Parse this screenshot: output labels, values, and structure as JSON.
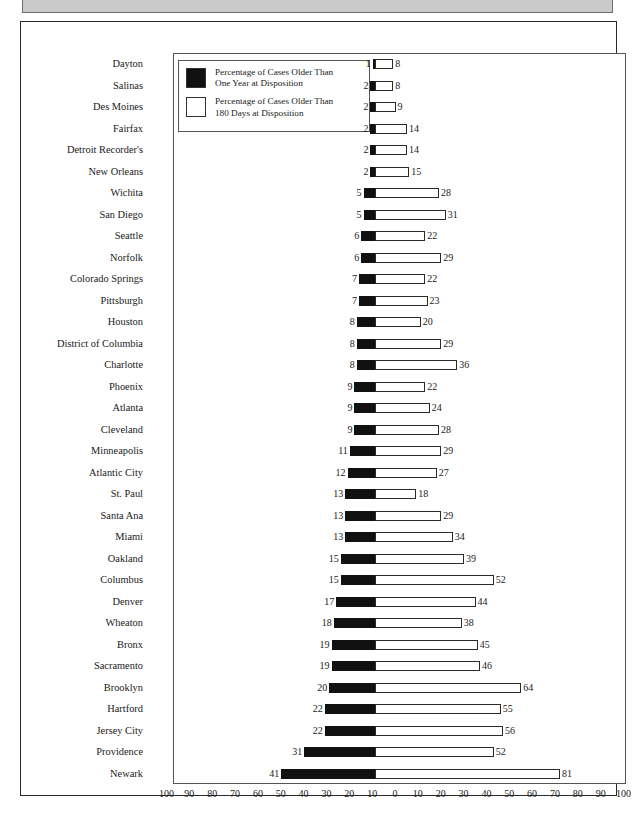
{
  "chart_data": {
    "type": "bar",
    "orientation": "horizontal-diverging",
    "title": "",
    "xlabel": "",
    "ylabel": "",
    "grid": false,
    "legend_position": "top-left-inside",
    "axis": {
      "ticks": [
        100,
        90,
        80,
        70,
        60,
        50,
        40,
        30,
        20,
        10,
        0,
        10,
        20,
        30,
        40,
        50,
        60,
        70,
        80,
        90,
        100
      ],
      "left_range": [
        0,
        100
      ],
      "right_range": [
        0,
        100
      ],
      "center_value": 0
    },
    "legend": [
      {
        "key": "over_one_year",
        "swatch": "black",
        "label": "Percentage of Cases Older Than\nOne Year at Disposition"
      },
      {
        "key": "over_180_days",
        "swatch": "white",
        "label": "Percentage of Cases Older Than\n180 Days at Disposition"
      }
    ],
    "series": [
      {
        "name": "Percentage of Cases Older Than One Year at Disposition",
        "key": "over_one_year",
        "side": "left",
        "swatch": "black"
      },
      {
        "name": "Percentage of Cases Older Than 180 Days at Disposition",
        "key": "over_180_days",
        "side": "right",
        "swatch": "white"
      }
    ],
    "categories": [
      "Dayton",
      "Salinas",
      "Des Moines",
      "Fairfax",
      "Detroit Recorder's",
      "New Orleans",
      "Wichita",
      "San Diego",
      "Seattle",
      "Norfolk",
      "Colorado Springs",
      "Pittsburgh",
      "Houston",
      "District of Columbia",
      "Charlotte",
      "Phoenix",
      "Atlanta",
      "Cleveland",
      "Minneapolis",
      "Atlantic City",
      "St. Paul",
      "Santa Ana",
      "Miami",
      "Oakland",
      "Columbus",
      "Denver",
      "Wheaton",
      "Bronx",
      "Sacramento",
      "Brooklyn",
      "Hartford",
      "Jersey City",
      "Providence",
      "Newark"
    ],
    "rows": [
      {
        "city": "Dayton",
        "over_one_year": 1,
        "over_180_days": 8
      },
      {
        "city": "Salinas",
        "over_one_year": 2,
        "over_180_days": 8
      },
      {
        "city": "Des Moines",
        "over_one_year": 2,
        "over_180_days": 9
      },
      {
        "city": "Fairfax",
        "over_one_year": 2,
        "over_180_days": 14
      },
      {
        "city": "Detroit Recorder's",
        "over_one_year": 2,
        "over_180_days": 14
      },
      {
        "city": "New Orleans",
        "over_one_year": 2,
        "over_180_days": 15
      },
      {
        "city": "Wichita",
        "over_one_year": 5,
        "over_180_days": 28
      },
      {
        "city": "San Diego",
        "over_one_year": 5,
        "over_180_days": 31
      },
      {
        "city": "Seattle",
        "over_one_year": 6,
        "over_180_days": 22
      },
      {
        "city": "Norfolk",
        "over_one_year": 6,
        "over_180_days": 29
      },
      {
        "city": "Colorado Springs",
        "over_one_year": 7,
        "over_180_days": 22
      },
      {
        "city": "Pittsburgh",
        "over_one_year": 7,
        "over_180_days": 23
      },
      {
        "city": "Houston",
        "over_one_year": 8,
        "over_180_days": 20
      },
      {
        "city": "District of Columbia",
        "over_one_year": 8,
        "over_180_days": 29
      },
      {
        "city": "Charlotte",
        "over_one_year": 8,
        "over_180_days": 36
      },
      {
        "city": "Phoenix",
        "over_one_year": 9,
        "over_180_days": 22
      },
      {
        "city": "Atlanta",
        "over_one_year": 9,
        "over_180_days": 24
      },
      {
        "city": "Cleveland",
        "over_one_year": 9,
        "over_180_days": 28
      },
      {
        "city": "Minneapolis",
        "over_one_year": 11,
        "over_180_days": 29
      },
      {
        "city": "Atlantic City",
        "over_one_year": 12,
        "over_180_days": 27
      },
      {
        "city": "St. Paul",
        "over_one_year": 13,
        "over_180_days": 18
      },
      {
        "city": "Santa Ana",
        "over_one_year": 13,
        "over_180_days": 29
      },
      {
        "city": "Miami",
        "over_one_year": 13,
        "over_180_days": 34
      },
      {
        "city": "Oakland",
        "over_one_year": 15,
        "over_180_days": 39
      },
      {
        "city": "Columbus",
        "over_one_year": 15,
        "over_180_days": 52
      },
      {
        "city": "Denver",
        "over_one_year": 17,
        "over_180_days": 44
      },
      {
        "city": "Wheaton",
        "over_one_year": 18,
        "over_180_days": 38
      },
      {
        "city": "Bronx",
        "over_one_year": 19,
        "over_180_days": 45
      },
      {
        "city": "Sacramento",
        "over_one_year": 19,
        "over_180_days": 46
      },
      {
        "city": "Brooklyn",
        "over_one_year": 20,
        "over_180_days": 64
      },
      {
        "city": "Hartford",
        "over_one_year": 22,
        "over_180_days": 55
      },
      {
        "city": "Jersey City",
        "over_one_year": 22,
        "over_180_days": 56
      },
      {
        "city": "Providence",
        "over_one_year": 31,
        "over_180_days": 52
      },
      {
        "city": "Newark",
        "over_one_year": 41,
        "over_180_days": 81
      }
    ]
  },
  "colors": {
    "bar_black": "#111111",
    "bar_white": "#ffffff",
    "bar_outline": "#2a2a2a",
    "frame": "#2a2a2a",
    "header_band": "#c9c9c9",
    "text": "#1a1a1a"
  }
}
